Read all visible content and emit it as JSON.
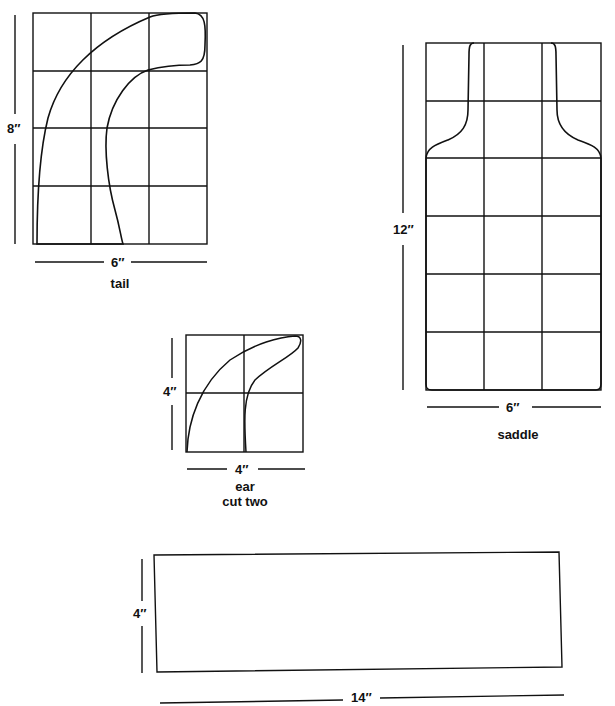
{
  "patterns": {
    "tail": {
      "name": "tail",
      "height_label": "8″",
      "width_label": "6″"
    },
    "saddle": {
      "name": "saddle",
      "height_label": "12″",
      "width_label": "6″"
    },
    "ear": {
      "name": "ear",
      "note": "cut two",
      "height_label": "4″",
      "width_label": "4″"
    },
    "strip": {
      "height_label": "4″",
      "width_label": "14″"
    }
  },
  "colors": {
    "line": "#111111",
    "background": "#ffffff"
  }
}
